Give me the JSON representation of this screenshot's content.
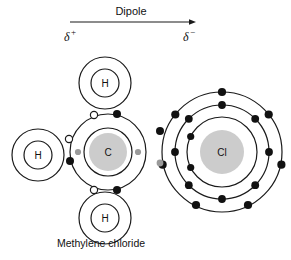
{
  "figure": {
    "caption": "Methylene chloride",
    "dipole": {
      "label": "Dipole",
      "positive_end": "δ",
      "positive_sign": "+",
      "negative_end": "δ",
      "negative_sign": "−"
    }
  },
  "atoms": {
    "carbon": {
      "symbol": "C"
    },
    "chlorine": {
      "symbol": "Cl"
    },
    "hydrogen_top": {
      "symbol": "H"
    },
    "hydrogen_left": {
      "symbol": "H"
    },
    "hydrogen_bottom": {
      "symbol": "H"
    }
  },
  "colors": {
    "stroke": "#1a1a1a",
    "electron_fill": "#111111",
    "shared_electron_fill": "#ffffff",
    "nucleus_fill": "#cccccc",
    "background": "#ffffff",
    "gray_electron_fill": "#9a9a9a"
  }
}
